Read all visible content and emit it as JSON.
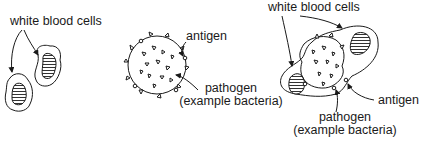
{
  "panels": [
    {
      "id": "white-blood-cells",
      "labels": {
        "cells": "white blood cells"
      }
    },
    {
      "id": "pathogen",
      "labels": {
        "antigen": "antigen",
        "pathogen_line1": "pathogen",
        "pathogen_line2": "(example bacteria)"
      }
    },
    {
      "id": "engulfing",
      "labels": {
        "cells": "white blood cells",
        "antigen": "antigen",
        "pathogen_line1": "pathogen",
        "pathogen_line2": "(example bacteria)"
      }
    }
  ],
  "colors": {
    "stroke": "#1a1a1a",
    "background": "#ffffff",
    "nucleus_fill": "#888888"
  }
}
